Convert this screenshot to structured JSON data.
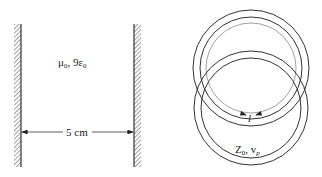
{
  "left_figure": {
    "medium_label": "μ",
    "medium_label_sub": "0",
    "medium_label_rest": ", 9ε",
    "medium_label_rest_sub": "0",
    "separation_label": "5 cm"
  },
  "right_figure": {
    "length_label": "l",
    "line_label_main": "Z",
    "line_label_sub": "0",
    "line_label_mid": ", v",
    "line_label_sub2": "p"
  },
  "colors": {
    "stroke": "#333333",
    "background": "#ffffff"
  }
}
